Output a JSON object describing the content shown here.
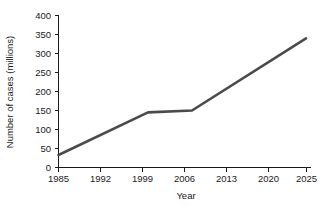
{
  "chart_data": {
    "type": "line",
    "title": "",
    "xlabel": "Year",
    "ylabel": "Number of cases (millions)",
    "x_tick_labels": [
      "1985",
      "1992",
      "1999",
      "2006",
      "2013",
      "2020",
      "2025"
    ],
    "y_tick_labels": [
      "0",
      "50",
      "100",
      "150",
      "200",
      "250",
      "300",
      "350",
      "400"
    ],
    "y_ticks": [
      0,
      50,
      100,
      150,
      200,
      250,
      300,
      350,
      400
    ],
    "ylim": [
      0,
      400
    ],
    "xlim_categories": [
      "1985",
      "1992",
      "1999",
      "2006",
      "2013",
      "2020",
      "2025"
    ],
    "axis_spacing": "even-category",
    "grid": false,
    "legend": "none",
    "series": [
      {
        "name": "Number of cases",
        "color": "#4a4a4a",
        "line_width": 2.6,
        "points": [
          {
            "year": 1985,
            "value": 33
          },
          {
            "year": 2000,
            "value": 145
          },
          {
            "year": 2008,
            "value": 150
          },
          {
            "year": 2025,
            "value": 340
          }
        ],
        "x_positions_px": [
          58.5,
          148,
          192,
          306
        ],
        "values": [
          33,
          145,
          150,
          340
        ]
      }
    ]
  },
  "axes": {
    "x_axis_name": "year-axis",
    "y_axis_name": "cases-axis"
  }
}
